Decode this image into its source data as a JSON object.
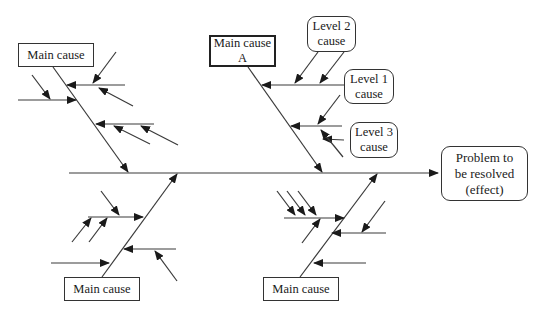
{
  "diagram": {
    "type": "fishbone (Ishikawa) diagram",
    "effect": {
      "label": "Problem to\nbe resolved\n(effect)"
    },
    "main_causes": [
      {
        "id": "top-left",
        "label": "Main cause"
      },
      {
        "id": "top-center",
        "label": "Main cause\nA"
      },
      {
        "id": "bottom-left",
        "label": "Main cause"
      },
      {
        "id": "bottom-center",
        "label": "Main cause"
      }
    ],
    "level_labels": [
      {
        "id": "level2",
        "label": "Level 2\ncause"
      },
      {
        "id": "level1",
        "label": "Level 1\ncause"
      },
      {
        "id": "level3",
        "label": "Level 3\ncause"
      }
    ],
    "colors": {
      "line": "#3a3a3a",
      "text": "#1a1a1a",
      "background": "#ffffff"
    }
  }
}
